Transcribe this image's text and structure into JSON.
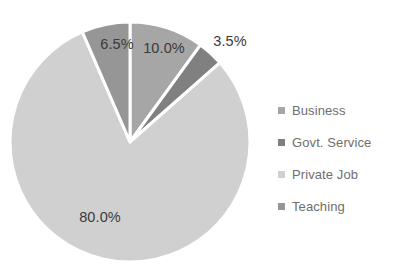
{
  "chart_data": {
    "type": "pie",
    "title": "",
    "title_sliver": "",
    "xlabel": "",
    "ylabel": "",
    "legend_position": "right",
    "grid": false,
    "start_angle_deg": 0,
    "direction": "clockwise",
    "categories": [
      "Business",
      "Govt. Service",
      "Private Job",
      "Teaching"
    ],
    "values": [
      10.0,
      3.5,
      80.0,
      6.5
    ],
    "data_labels": [
      "10.0%",
      "3.5%",
      "80.0%",
      "6.5%"
    ],
    "colors": [
      "#a6a6a6",
      "#808080",
      "#d0d0d0",
      "#969696"
    ],
    "slices": [
      {
        "label": "Business",
        "value": 10.0,
        "data_label": "10.0%",
        "color": "#a6a6a6",
        "label_x": 164,
        "label_y": 48
      },
      {
        "label": "Govt. Service",
        "value": 3.5,
        "data_label": "3.5%",
        "color": "#808080",
        "label_x": 230,
        "label_y": 41
      },
      {
        "label": "Private Job",
        "value": 80.0,
        "data_label": "80.0%",
        "color": "#d0d0d0",
        "label_x": 100,
        "label_y": 217
      },
      {
        "label": "Teaching",
        "value": 6.5,
        "data_label": "6.5%",
        "color": "#969696",
        "label_x": 117,
        "label_y": 44
      }
    ],
    "geometry": {
      "center_x": 130,
      "center_y": 142,
      "radius": 120,
      "separator_color": "#ffffff",
      "separator_width": 3
    }
  },
  "legend": {
    "items": [
      {
        "label": "Business",
        "color": "#a6a6a6"
      },
      {
        "label": "Govt. Service",
        "color": "#808080"
      },
      {
        "label": "Private Job",
        "color": "#d0d0d0"
      },
      {
        "label": "Teaching",
        "color": "#969696"
      }
    ]
  }
}
